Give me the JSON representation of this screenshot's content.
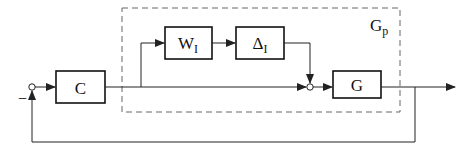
{
  "diagram": {
    "type": "feedback-control-block-diagram",
    "colors": {
      "line": "#222222",
      "block_border": "#111111",
      "dashed_box": "#666666",
      "background": "#ffffff"
    },
    "blocks": [
      {
        "id": "C",
        "label": "C"
      },
      {
        "id": "WI",
        "label": "W",
        "subscript": "I"
      },
      {
        "id": "DeltaI",
        "label": "Δ",
        "subscript": "I"
      },
      {
        "id": "G",
        "label": "G"
      }
    ],
    "group": {
      "id": "Gp",
      "label": "G",
      "subscript": "p",
      "style": "dashed"
    },
    "summing_junctions": [
      {
        "id": "sum1",
        "feedback_sign": "−"
      },
      {
        "id": "sum2"
      }
    ],
    "connections": [
      "input → sum1",
      "sum1 → C",
      "C → branch",
      "branch → WI",
      "WI → DeltaI",
      "DeltaI → sum2",
      "branch → sum2",
      "sum2 → G",
      "G → output",
      "output → feedback → sum1 (negative)"
    ]
  }
}
